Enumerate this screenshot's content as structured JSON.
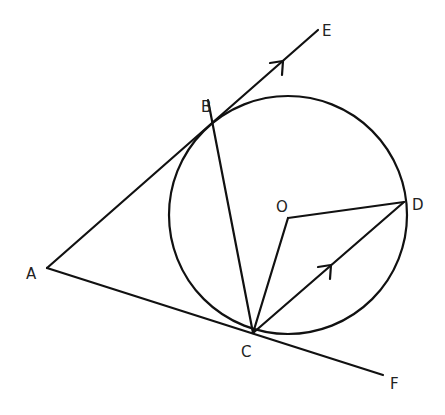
{
  "diagram": {
    "type": "geometry-circle-tangents",
    "circle": {
      "center_label": "O",
      "cx": 288,
      "cy": 215,
      "r": 119
    },
    "points": {
      "A": {
        "label": "A",
        "x": 47,
        "y": 268
      },
      "B": {
        "label": "B",
        "x": 208,
        "y": 100
      },
      "C": {
        "label": "C",
        "x": 253,
        "y": 333
      },
      "D": {
        "label": "D",
        "x": 404,
        "y": 202
      },
      "O": {
        "label": "O",
        "x": 288,
        "y": 218
      },
      "E": {
        "label": "E",
        "x": 318,
        "y": 30
      },
      "F": {
        "label": "F",
        "x": 383,
        "y": 385
      }
    },
    "segments": [
      "A-E",
      "A-F",
      "B-C",
      "O-C",
      "O-D",
      "C-D"
    ],
    "arrows": [
      "on AE (parallel mark)",
      "on CD (parallel mark)"
    ],
    "labels": {
      "A": "A",
      "B": "B",
      "C": "C",
      "D": "D",
      "O": "O",
      "E": "E",
      "F": "F"
    }
  }
}
